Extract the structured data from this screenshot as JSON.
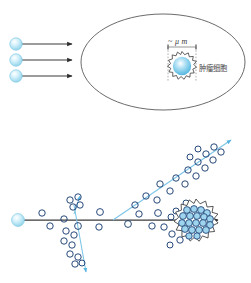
{
  "figure": {
    "background": "#ffffff",
    "panels": {
      "top": {
        "name": "incident-beam-into-tissue",
        "tissue_shape": "ellipse",
        "tissue_stroke": "#5a5a5a",
        "incident_particles": 3,
        "arrow_color": "#3b3b3b",
        "particle_color": "#bfe8f5",
        "scale_label": "~ μ m",
        "cell_label": "肿瘤细胞",
        "cell_label_note": "tumor cell",
        "cell_render": "starburst-with-blue-gradient-core",
        "bracket_style": "dashed"
      },
      "bottom": {
        "name": "particle-track-with-secondary-scatter",
        "primary_track_color": "#3b3b3b",
        "secondary_track_color": "#7ec6e8",
        "circle_outline": "#1b3f73",
        "cluster_fill": "#9fd4ee",
        "source_particle_color": "#bfe8f5",
        "tracks": [
          {
            "id": "primary",
            "label": "primary-ion-track",
            "direction": "right",
            "arrow": true
          },
          {
            "id": "secondary-up",
            "label": "secondary-electron-track-up",
            "direction": "up-right",
            "arrow": true
          },
          {
            "id": "secondary-down",
            "label": "secondary-electron-track-down",
            "direction": "down-left",
            "arrow": true
          }
        ],
        "target_cluster": "tumor-cell-cluster"
      }
    },
    "colors": {
      "accent_blue": "#7ec6e8",
      "deep_blue": "#1b3f73",
      "pale_blue": "#bfe8f5",
      "ink": "#3b3b3b",
      "outline_gray": "#5a5a5a"
    }
  }
}
